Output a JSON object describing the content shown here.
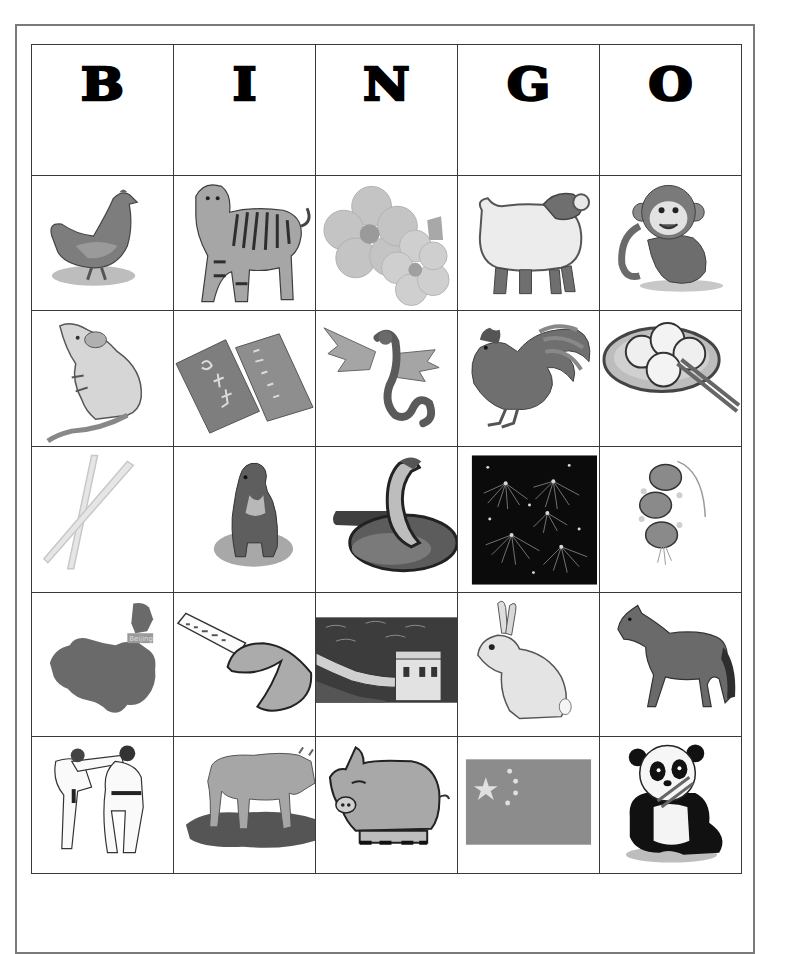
{
  "card": {
    "header": [
      "B",
      "I",
      "N",
      "G",
      "O"
    ],
    "rows": [
      [
        {
          "name": "chicken",
          "icon": "chicken-icon"
        },
        {
          "name": "tiger",
          "icon": "tiger-icon"
        },
        {
          "name": "plum blossom flowers",
          "icon": "flower-icon"
        },
        {
          "name": "ram / sheep",
          "icon": "sheep-icon"
        },
        {
          "name": "monkey",
          "icon": "monkey-icon"
        }
      ],
      [
        {
          "name": "rat",
          "icon": "rat-icon"
        },
        {
          "name": "Chinese calligraphy red envelopes",
          "icon": "red-envelope-icon"
        },
        {
          "name": "dragon",
          "icon": "dragon-icon"
        },
        {
          "name": "rooster",
          "icon": "rooster-icon"
        },
        {
          "name": "dumplings with chopsticks",
          "icon": "dumplings-icon"
        }
      ],
      [
        {
          "name": "chopsticks",
          "icon": "chopsticks-icon"
        },
        {
          "name": "dog",
          "icon": "dog-icon"
        },
        {
          "name": "snake (cobra)",
          "icon": "snake-icon"
        },
        {
          "name": "fireworks",
          "icon": "fireworks-icon"
        },
        {
          "name": "paper lanterns",
          "icon": "lantern-icon"
        }
      ],
      [
        {
          "name": "map of China",
          "icon": "china-map-icon",
          "label": "Beijing"
        },
        {
          "name": "fortune cookie",
          "icon": "fortune-cookie-icon"
        },
        {
          "name": "Great Wall of China",
          "icon": "great-wall-icon"
        },
        {
          "name": "rabbit",
          "icon": "rabbit-icon"
        },
        {
          "name": "horse",
          "icon": "horse-icon"
        }
      ],
      [
        {
          "name": "martial arts",
          "icon": "martial-arts-icon"
        },
        {
          "name": "ox",
          "icon": "ox-icon"
        },
        {
          "name": "pig",
          "icon": "pig-icon"
        },
        {
          "name": "flag of China",
          "icon": "china-flag-icon"
        },
        {
          "name": "panda",
          "icon": "panda-icon"
        }
      ]
    ]
  },
  "colors": {
    "border": "#3a3a3a",
    "page_border": "#7a7a7a",
    "ink": "#000000",
    "mid_gray": "#8a8a8a",
    "light_gray": "#cfcfcf"
  }
}
